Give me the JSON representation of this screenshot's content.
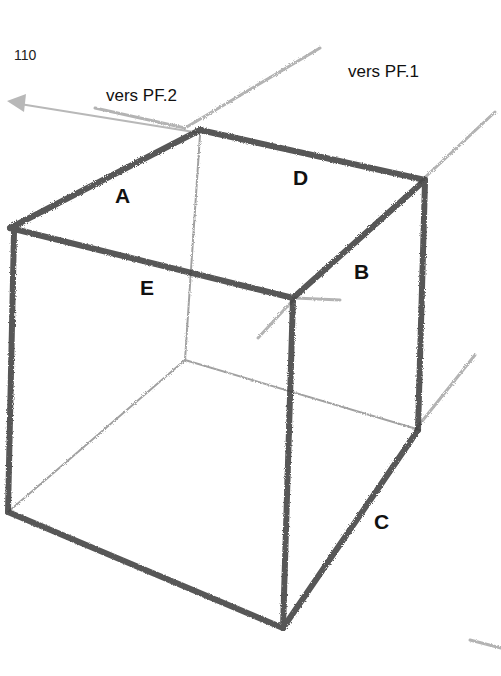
{
  "page_number": "110",
  "directions": {
    "pf2": "vers PF.2",
    "pf1": "vers PF.1"
  },
  "edge_labels": {
    "A": "A",
    "B": "B",
    "C": "C",
    "D": "D",
    "E": "E"
  },
  "colors": {
    "pencil": "#3a3a3a",
    "faint_pencil": "#8a8a8a",
    "arrow": "#b5b5b5",
    "background": "#ffffff"
  }
}
